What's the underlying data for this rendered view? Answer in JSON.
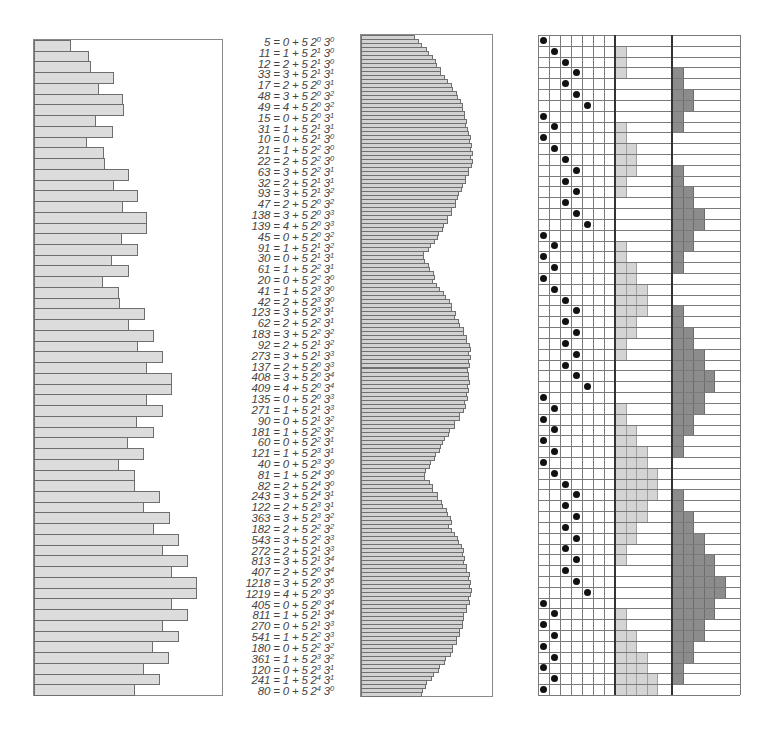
{
  "figure": {
    "colors": {
      "bar_fill": "#dcdcdc",
      "bar_stroke": "#6e6e6e",
      "power2_fill": "#d4d4d4",
      "power3_fill": "#8c8c8c",
      "dot": "#111111",
      "text": "#444444"
    }
  },
  "equations": [
    {
      "n": 5,
      "a": 0,
      "i": 0,
      "j": 0
    },
    {
      "n": 11,
      "a": 1,
      "i": 1,
      "j": 0
    },
    {
      "n": 12,
      "a": 2,
      "i": 1,
      "j": 0
    },
    {
      "n": 33,
      "a": 3,
      "i": 1,
      "j": 1
    },
    {
      "n": 17,
      "a": 2,
      "i": 0,
      "j": 1
    },
    {
      "n": 48,
      "a": 3,
      "i": 0,
      "j": 2
    },
    {
      "n": 49,
      "a": 4,
      "i": 0,
      "j": 2
    },
    {
      "n": 15,
      "a": 0,
      "i": 0,
      "j": 1
    },
    {
      "n": 31,
      "a": 1,
      "i": 1,
      "j": 1
    },
    {
      "n": 10,
      "a": 0,
      "i": 1,
      "j": 0
    },
    {
      "n": 21,
      "a": 1,
      "i": 2,
      "j": 0
    },
    {
      "n": 22,
      "a": 2,
      "i": 2,
      "j": 0
    },
    {
      "n": 63,
      "a": 3,
      "i": 2,
      "j": 1
    },
    {
      "n": 32,
      "a": 2,
      "i": 1,
      "j": 1
    },
    {
      "n": 93,
      "a": 3,
      "i": 1,
      "j": 2
    },
    {
      "n": 47,
      "a": 2,
      "i": 0,
      "j": 2
    },
    {
      "n": 138,
      "a": 3,
      "i": 0,
      "j": 3
    },
    {
      "n": 139,
      "a": 4,
      "i": 0,
      "j": 3
    },
    {
      "n": 45,
      "a": 0,
      "i": 0,
      "j": 2
    },
    {
      "n": 91,
      "a": 1,
      "i": 1,
      "j": 2
    },
    {
      "n": 30,
      "a": 0,
      "i": 1,
      "j": 1
    },
    {
      "n": 61,
      "a": 1,
      "i": 2,
      "j": 1
    },
    {
      "n": 20,
      "a": 0,
      "i": 2,
      "j": 0
    },
    {
      "n": 41,
      "a": 1,
      "i": 3,
      "j": 0
    },
    {
      "n": 42,
      "a": 2,
      "i": 3,
      "j": 0
    },
    {
      "n": 123,
      "a": 3,
      "i": 3,
      "j": 1
    },
    {
      "n": 62,
      "a": 2,
      "i": 2,
      "j": 1
    },
    {
      "n": 183,
      "a": 3,
      "i": 2,
      "j": 2
    },
    {
      "n": 92,
      "a": 2,
      "i": 1,
      "j": 2
    },
    {
      "n": 273,
      "a": 3,
      "i": 1,
      "j": 3
    },
    {
      "n": 137,
      "a": 2,
      "i": 0,
      "j": 3
    },
    {
      "n": 408,
      "a": 3,
      "i": 0,
      "j": 4
    },
    {
      "n": 409,
      "a": 4,
      "i": 0,
      "j": 4
    },
    {
      "n": 135,
      "a": 0,
      "i": 0,
      "j": 3
    },
    {
      "n": 271,
      "a": 1,
      "i": 1,
      "j": 3
    },
    {
      "n": 90,
      "a": 0,
      "i": 1,
      "j": 2
    },
    {
      "n": 181,
      "a": 1,
      "i": 2,
      "j": 2
    },
    {
      "n": 60,
      "a": 0,
      "i": 2,
      "j": 1
    },
    {
      "n": 121,
      "a": 1,
      "i": 3,
      "j": 1
    },
    {
      "n": 40,
      "a": 0,
      "i": 3,
      "j": 0
    },
    {
      "n": 81,
      "a": 1,
      "i": 4,
      "j": 0
    },
    {
      "n": 82,
      "a": 2,
      "i": 4,
      "j": 0
    },
    {
      "n": 243,
      "a": 3,
      "i": 4,
      "j": 1
    },
    {
      "n": 122,
      "a": 2,
      "i": 3,
      "j": 1
    },
    {
      "n": 363,
      "a": 3,
      "i": 3,
      "j": 2
    },
    {
      "n": 182,
      "a": 2,
      "i": 2,
      "j": 2
    },
    {
      "n": 543,
      "a": 3,
      "i": 2,
      "j": 3
    },
    {
      "n": 272,
      "a": 2,
      "i": 1,
      "j": 3
    },
    {
      "n": 813,
      "a": 3,
      "i": 1,
      "j": 4
    },
    {
      "n": 407,
      "a": 2,
      "i": 0,
      "j": 4
    },
    {
      "n": 1218,
      "a": 3,
      "i": 0,
      "j": 5
    },
    {
      "n": 1219,
      "a": 4,
      "i": 0,
      "j": 5
    },
    {
      "n": 405,
      "a": 0,
      "i": 0,
      "j": 4
    },
    {
      "n": 811,
      "a": 1,
      "i": 1,
      "j": 4
    },
    {
      "n": 270,
      "a": 0,
      "i": 1,
      "j": 3
    },
    {
      "n": 541,
      "a": 1,
      "i": 2,
      "j": 3
    },
    {
      "n": 180,
      "a": 0,
      "i": 2,
      "j": 2
    },
    {
      "n": 361,
      "a": 1,
      "i": 3,
      "j": 2
    },
    {
      "n": 120,
      "a": 0,
      "i": 3,
      "j": 1
    },
    {
      "n": 241,
      "a": 1,
      "i": 4,
      "j": 1
    },
    {
      "n": 80,
      "a": 0,
      "i": 4,
      "j": 0
    }
  ],
  "chart_data": [
    {
      "type": "bar",
      "orientation": "horizontal",
      "title": "",
      "xlabel": "",
      "ylabel": "",
      "scale": "log",
      "categories_from": "equations.n",
      "values": [
        5,
        11,
        12,
        33,
        17,
        48,
        49,
        15,
        31,
        10,
        21,
        22,
        63,
        32,
        93,
        47,
        138,
        139,
        45,
        91,
        30,
        61,
        20,
        41,
        42,
        123,
        62,
        183,
        92,
        273,
        137,
        408,
        409,
        135,
        271,
        90,
        181,
        60,
        121,
        40,
        81,
        82,
        243,
        122,
        363,
        182,
        543,
        272,
        813,
        407,
        1218,
        1219,
        405,
        811,
        270,
        541,
        180,
        361,
        120,
        241,
        80
      ],
      "grid": false,
      "legend": null
    },
    {
      "type": "bar",
      "orientation": "horizontal",
      "title": "",
      "scale": "log",
      "note": "Dense continuation of the same sequence (~165 thin bars), three peaks",
      "grid": false,
      "legend": null
    }
  ],
  "grid_panel": {
    "dot_columns": 5,
    "spare_columns": 1,
    "power2_max": 5,
    "power3_max": 6
  }
}
